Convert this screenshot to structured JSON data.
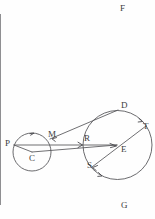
{
  "figure": {
    "background_color": "#fefefe",
    "ink_color": "#555558",
    "width": 155,
    "height": 219
  },
  "labels": {
    "F": "F",
    "G": "G",
    "D": "D",
    "E": "E",
    "T": "T",
    "R": "R",
    "S": "S",
    "P": "P",
    "M": "M",
    "C": "C"
  },
  "points": [
    {
      "name": "F",
      "label": "F",
      "x": 120,
      "y": 4
    },
    {
      "name": "D",
      "label": "D",
      "x": 121,
      "y": 101
    },
    {
      "name": "T",
      "label": "T",
      "x": 143,
      "y": 122
    },
    {
      "name": "E",
      "label": "E",
      "x": 121,
      "y": 145
    },
    {
      "name": "R",
      "label": "R",
      "x": 84,
      "y": 134
    },
    {
      "name": "S",
      "label": "S",
      "x": 87,
      "y": 161
    },
    {
      "name": "M",
      "label": "M",
      "x": 48,
      "y": 130
    },
    {
      "name": "P",
      "label": "P",
      "x": 5,
      "y": 139
    },
    {
      "name": "C",
      "label": "C",
      "x": 29,
      "y": 154
    },
    {
      "name": "G",
      "label": "G",
      "x": 121,
      "y": 201
    }
  ],
  "circles": [
    {
      "name": "circle-C",
      "cx": 32,
      "cy": 152,
      "r": 19
    },
    {
      "name": "circle-E",
      "cx": 117.5,
      "cy": 145,
      "r": 34.5
    }
  ],
  "vertical_line": {
    "name": "line-FG",
    "x": 118.5,
    "y1": 14,
    "y2": 205
  },
  "segments": [
    {
      "name": "segment-P-E",
      "x1": 14,
      "y1": 145,
      "x2": 117,
      "y2": 145
    },
    {
      "name": "segment-P-C",
      "x1": 14,
      "y1": 145,
      "x2": 32,
      "y2": 152
    },
    {
      "name": "segment-C-E",
      "x1": 32,
      "y1": 152,
      "x2": 117,
      "y2": 145
    },
    {
      "name": "segment-M-D",
      "x1": 50,
      "y1": 139,
      "x2": 118,
      "y2": 110
    },
    {
      "name": "segment-S-T",
      "x1": 92,
      "y1": 167,
      "x2": 146,
      "y2": 126
    }
  ]
}
